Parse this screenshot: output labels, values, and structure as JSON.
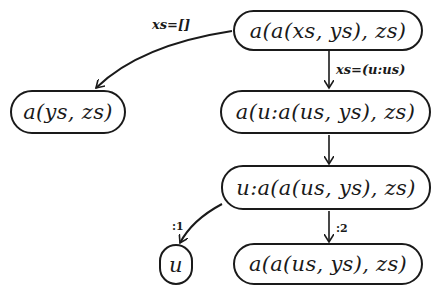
{
  "diagram": {
    "type": "rewrite-tree",
    "colors": {
      "stroke": "#1a1a1a",
      "background": "#ffffff"
    },
    "nodes": [
      {
        "id": "n1",
        "label": "a(a(xs, ys), zs)"
      },
      {
        "id": "n2",
        "label": "a(ys, zs)"
      },
      {
        "id": "n3",
        "label": "a(u:a(us, ys), zs)"
      },
      {
        "id": "n4",
        "label": "u:a(a(us, ys), zs)"
      },
      {
        "id": "n5",
        "label": "u"
      },
      {
        "id": "n6",
        "label": "a(a(us, ys), zs)"
      }
    ],
    "edges": [
      {
        "from": "n1",
        "to": "n2",
        "label": "xs=[]"
      },
      {
        "from": "n1",
        "to": "n3",
        "label": "xs=(u:us)"
      },
      {
        "from": "n3",
        "to": "n4",
        "label": ""
      },
      {
        "from": "n4",
        "to": "n5",
        "label": ":1"
      },
      {
        "from": "n4",
        "to": "n6",
        "label": ":2"
      }
    ]
  }
}
